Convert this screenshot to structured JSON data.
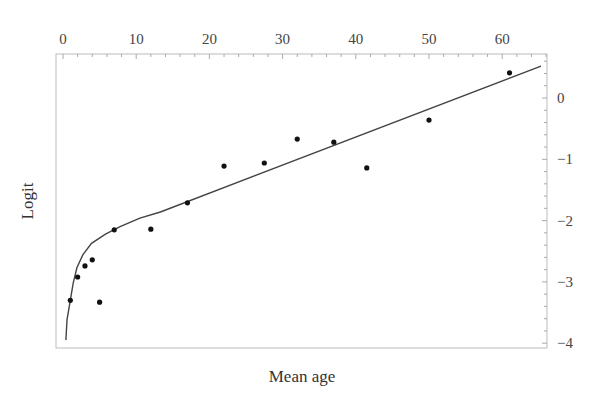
{
  "chart_data": {
    "type": "scatter",
    "title": "",
    "xlabel": "Mean age",
    "ylabel": "Logit",
    "xlim": [
      0,
      66
    ],
    "ylim": [
      -4.08,
      0.72
    ],
    "x_ticks": [
      0,
      10,
      20,
      30,
      40,
      50,
      60
    ],
    "y_ticks": [
      0,
      -1,
      -2,
      -3,
      -4
    ],
    "x_axis_position": "top",
    "y_axis_position": "right",
    "grid": false,
    "legend": null,
    "series": [
      {
        "name": "observed",
        "type": "scatter",
        "points": [
          {
            "x": 1,
            "y": -3.3
          },
          {
            "x": 2,
            "y": -2.92
          },
          {
            "x": 3,
            "y": -2.74
          },
          {
            "x": 4,
            "y": -2.64
          },
          {
            "x": 5,
            "y": -3.33
          },
          {
            "x": 7,
            "y": -2.15
          },
          {
            "x": 12,
            "y": -2.14
          },
          {
            "x": 17,
            "y": -1.71
          },
          {
            "x": 22,
            "y": -1.11
          },
          {
            "x": 27.5,
            "y": -1.06
          },
          {
            "x": 32,
            "y": -0.67
          },
          {
            "x": 37,
            "y": -0.72
          },
          {
            "x": 41.5,
            "y": -1.14
          },
          {
            "x": 50,
            "y": -0.36
          },
          {
            "x": 61,
            "y": 0.41
          }
        ]
      },
      {
        "name": "fitted curve",
        "type": "line",
        "points": [
          {
            "x": 0.4,
            "y": -3.95
          },
          {
            "x": 0.55,
            "y": -3.62
          },
          {
            "x": 1,
            "y": -3.3
          },
          {
            "x": 1.4,
            "y": -3.02
          },
          {
            "x": 1.9,
            "y": -2.77
          },
          {
            "x": 2.7,
            "y": -2.56
          },
          {
            "x": 3.9,
            "y": -2.37
          },
          {
            "x": 5.8,
            "y": -2.22
          },
          {
            "x": 7.8,
            "y": -2.1
          },
          {
            "x": 10.5,
            "y": -1.96
          },
          {
            "x": 13.3,
            "y": -1.86
          },
          {
            "x": 65.3,
            "y": 0.52
          }
        ]
      }
    ]
  },
  "axes": {
    "x_label": "Mean age",
    "y_label": "Logit"
  }
}
